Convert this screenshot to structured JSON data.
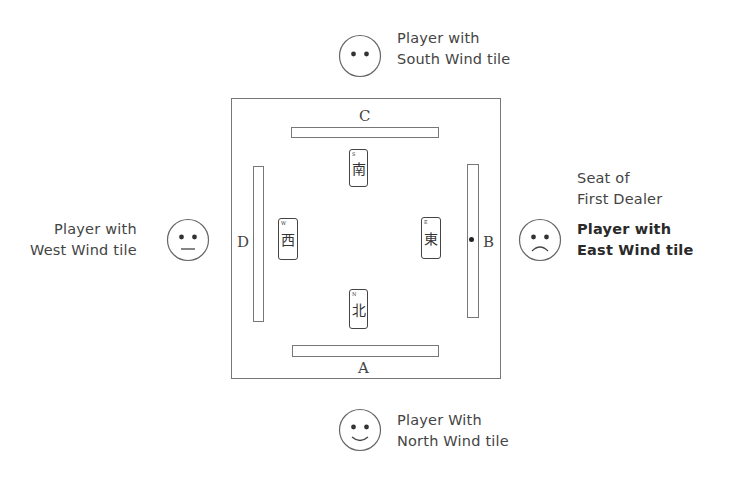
{
  "diagram": {
    "players": {
      "south": {
        "line1": "Player with",
        "line2": "South Wind tile",
        "face": "neutral-face-icon"
      },
      "west": {
        "line1": "Player with",
        "line2": "West Wind tile",
        "face": "flat-mouth-face-icon"
      },
      "east": {
        "note_line1": "Seat of",
        "note_line2": "First Dealer",
        "line1": "Player with",
        "line2": "East Wind tile",
        "face": "frown-face-icon"
      },
      "north": {
        "line1": "Player With",
        "line2": "North Wind tile",
        "face": "smile-face-icon"
      }
    },
    "walls": {
      "top": "C",
      "right": "B",
      "bottom": "A",
      "left": "D"
    },
    "tiles": {
      "south": {
        "char": "南",
        "corner": "S"
      },
      "west": {
        "char": "西",
        "corner": "W"
      },
      "east": {
        "char": "東",
        "corner": "E"
      },
      "north": {
        "char": "北",
        "corner": "N"
      }
    },
    "dealer_marker": "dot beside wall B"
  }
}
